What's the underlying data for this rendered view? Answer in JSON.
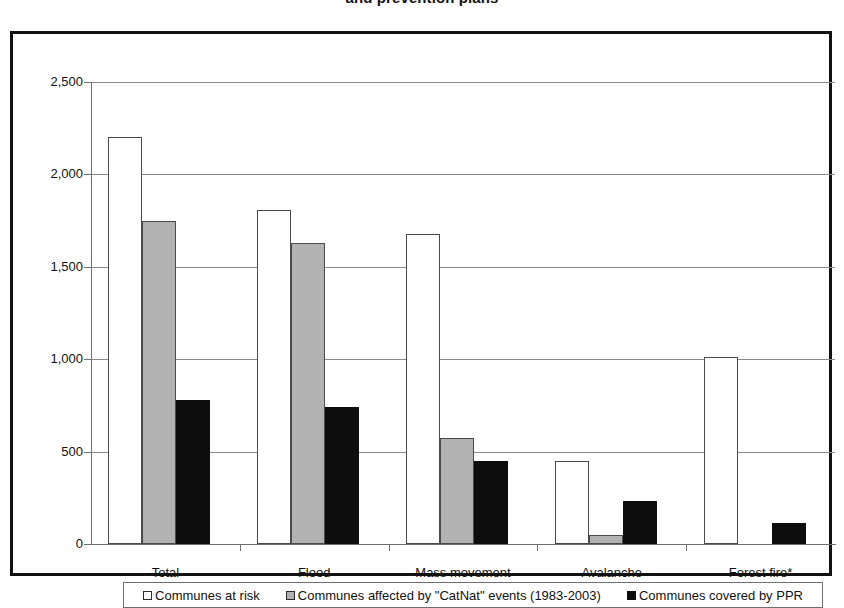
{
  "title": "and prevention plans",
  "chart_data": {
    "type": "bar",
    "title": "and prevention plans",
    "xlabel": "",
    "ylabel": "",
    "ylim": [
      0,
      2500
    ],
    "yticks": [
      0,
      500,
      1000,
      1500,
      2000,
      2500
    ],
    "ytick_labels": [
      "0",
      "500",
      "1,000",
      "1,500",
      "2,000",
      "2,500"
    ],
    "grid": true,
    "legend_position": "bottom",
    "categories": [
      "Total",
      "Flood",
      "Mass movement",
      "Avalanche",
      "Forest fire*"
    ],
    "series": [
      {
        "name": "Communes at risk",
        "color": "#ffffff",
        "values": [
          2200,
          1810,
          1680,
          450,
          1010
        ]
      },
      {
        "name": "Communes affected by \"CatNat\" events (1983-2003)",
        "color": "#b2b2b2",
        "values": [
          1750,
          1630,
          575,
          50,
          0
        ]
      },
      {
        "name": "Communes covered by PPR",
        "color": "#0d0d0d",
        "values": [
          780,
          740,
          450,
          235,
          115
        ]
      }
    ]
  },
  "colors": {
    "series_white": "#ffffff",
    "series_gray": "#b2b2b2",
    "series_black": "#0d0d0d",
    "gridline": "#8b8b8b",
    "frame": "#111111"
  }
}
